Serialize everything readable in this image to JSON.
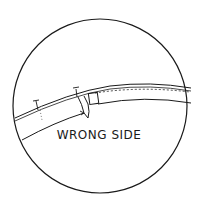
{
  "diagram": {
    "label": "WRONG SIDE",
    "stroke_color": "#1a1a1a",
    "background": "#ffffff"
  }
}
